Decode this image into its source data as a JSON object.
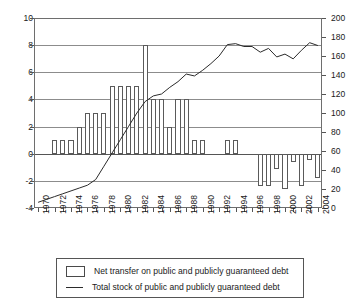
{
  "axes": {
    "left_ticks": [
      "10",
      "8",
      "6",
      "4",
      "2",
      "0",
      "-2",
      "-4"
    ],
    "right_ticks": [
      "200",
      "180",
      "160",
      "140",
      "120",
      "100",
      "80",
      "60",
      "40",
      "20",
      "0"
    ],
    "year_ticks": [
      "1970",
      "1972",
      "1974",
      "1976",
      "1978",
      "1980",
      "1982",
      "1984",
      "1986",
      "1988",
      "1990",
      "1992",
      "1994",
      "1996",
      "1998",
      "2000",
      "2002",
      "2004"
    ]
  },
  "legend": {
    "bar_label": "Net transfer on public and publicly guaranteed debt",
    "line_label": "Total stock of public and publicly guaranteed debt",
    "bar_swatch": "open-rectangle",
    "line_swatch": "solid-line"
  },
  "colors": {
    "bar_stroke": "#5a5a5a",
    "bar_fill": "#ffffff",
    "line": "#2b2b2b",
    "grid": "#8c8c8c",
    "frame": "#6e6e6e",
    "text": "#1a1a1a"
  },
  "chart_data": {
    "type": "bar",
    "title": "",
    "xlabel": "",
    "ylabel": "",
    "grid": true,
    "legend_position": "bottom",
    "x": [
      1970,
      1971,
      1972,
      1973,
      1974,
      1975,
      1976,
      1977,
      1978,
      1979,
      1980,
      1981,
      1982,
      1983,
      1984,
      1985,
      1986,
      1987,
      1988,
      1989,
      1990,
      1991,
      1992,
      1993,
      1994,
      1995,
      1996,
      1997,
      1998,
      1999,
      2000,
      2001,
      2002,
      2003,
      2004
    ],
    "ylim": [
      -4,
      10
    ],
    "y2lim": [
      0,
      200
    ],
    "series": [
      {
        "name": "Net transfer on public and publicly guaranteed debt",
        "type": "bar",
        "axis": "left",
        "unit": "",
        "values": [
          0,
          0,
          1,
          1,
          1,
          2,
          3,
          3,
          3,
          5,
          5,
          5,
          5,
          8,
          4,
          4,
          2,
          4,
          4,
          1,
          1,
          0,
          0,
          1,
          1,
          0,
          0,
          -2.4,
          -2.4,
          -1.1,
          -2.6,
          -0.6,
          -2.4,
          -0.5,
          -1.8
        ]
      },
      {
        "name": "Total stock of public and publicly guaranteed debt",
        "type": "line",
        "axis": "right",
        "unit": "",
        "values": [
          6,
          9,
          12,
          15,
          18,
          21,
          24,
          30,
          44,
          58,
          72,
          86,
          100,
          112,
          118,
          120,
          127,
          133,
          141,
          139,
          145,
          152,
          160,
          172,
          173,
          170,
          170,
          164,
          168,
          159,
          162,
          157,
          166,
          174,
          171
        ]
      }
    ]
  }
}
